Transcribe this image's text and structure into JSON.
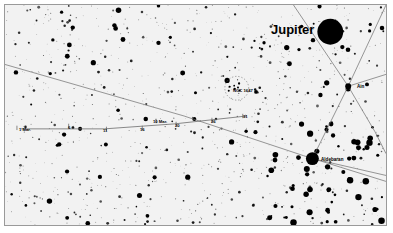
{
  "chart_data": {
    "type": "scatter",
    "title": "",
    "subtitle": "",
    "xlabel": "",
    "ylabel": "",
    "grid": false,
    "legend_position": "none",
    "background_color": "#f2f2f2",
    "frame_color": "#9a9a9a",
    "star_color": "#000000",
    "line_color": "#6b6b6b",
    "planet_track": {
      "name": "Jupiter motion track",
      "ticks": [
        {
          "label": "1 Mar.",
          "x": 16,
          "y": 128
        },
        {
          "label": "6",
          "x": 68,
          "y": 126
        },
        {
          "label": "11",
          "x": 106,
          "y": 129
        },
        {
          "label": "16",
          "x": 142,
          "y": 128
        },
        {
          "label": "10 Mar.",
          "x": 156,
          "y": 121
        },
        {
          "label": "20",
          "x": 176,
          "y": 124
        },
        {
          "label": "26",
          "x": 212,
          "y": 120
        },
        {
          "label": "31",
          "x": 243,
          "y": 116
        }
      ]
    },
    "deep_sky_objects": [
      {
        "label": "NGC 1647",
        "x": 237,
        "y": 88,
        "marker": "dotted-circle"
      }
    ],
    "named_stars": [
      {
        "label": "Aldebaran",
        "x": 313,
        "y": 159,
        "magnitude_size": 13
      },
      {
        "label": "Ain",
        "x": 349,
        "y": 86,
        "magnitude_size": 6
      }
    ],
    "planets": [
      {
        "label": "Jupiter",
        "x": 331,
        "y": 31,
        "disk_diameter": 26
      }
    ]
  },
  "labels": {
    "jupiter": "Jupiter",
    "aldebaran": "Aldebaran",
    "ain": "Ain",
    "ngc1647": "NGC 1647",
    "tick_1mar": "1 Mar.",
    "tick_6": "6",
    "tick_11": "11",
    "tick_16": "16",
    "tick_10mar": "10 Mar.",
    "tick_20": "20",
    "tick_26": "26",
    "tick_31": "31"
  }
}
